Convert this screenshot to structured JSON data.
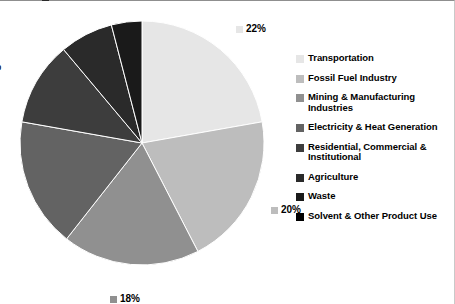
{
  "chart_data": {
    "type": "pie",
    "title": "",
    "subtitle": "",
    "xlabel": "",
    "ylabel": "",
    "grid": false,
    "legend_position": "right",
    "start_angle_deg": 0,
    "direction": "clockwise",
    "categories": [
      "Transportation",
      "Fossil Fuel Industry",
      "Mining & Manufacturing Industries",
      "Electricity & Heat Generation",
      "Residential, Commercial & Institutional",
      "Agriculture",
      "Waste",
      "Solvent & Other Product Use"
    ],
    "values": [
      22,
      20,
      18,
      17,
      11,
      7,
      4,
      0
    ],
    "labels": [
      "22%",
      "20%",
      "18%",
      "17%",
      "11%",
      "7%",
      "4%",
      "0%"
    ],
    "colors": [
      "#e6e6e6",
      "#bdbdbd",
      "#909090",
      "#636363",
      "#3d3d3d",
      "#2a2a2a",
      "#1a1a1a",
      "#000000"
    ],
    "slices": [
      {
        "label": "Transportation",
        "value": 22,
        "display": "22%",
        "color": "#e6e6e6"
      },
      {
        "label": "Fossil Fuel Industry",
        "value": 20,
        "display": "20%",
        "color": "#bdbdbd"
      },
      {
        "label": "Mining & Manufacturing Industries",
        "value": 18,
        "display": "18%",
        "color": "#909090"
      },
      {
        "label": "Electricity & Heat Generation",
        "value": 17,
        "display": "17%",
        "color": "#636363"
      },
      {
        "label": "Residential, Commercial & Institutional",
        "value": 11,
        "display": "11%",
        "color": "#3d3d3d"
      },
      {
        "label": "Agriculture",
        "value": 7,
        "display": "7%",
        "color": "#2a2a2a"
      },
      {
        "label": "Waste",
        "value": 4,
        "display": "4%",
        "color": "#1a1a1a"
      },
      {
        "label": "Solvent & Other Product Use",
        "value": 0,
        "display": "0%",
        "color": "#000000"
      }
    ]
  },
  "legend": {
    "items": [
      {
        "label": "Transportation",
        "color": "#e6e6e6"
      },
      {
        "label": "Fossil Fuel Industry",
        "color": "#bdbdbd"
      },
      {
        "label": "Mining & Manufacturing Industries",
        "color": "#909090"
      },
      {
        "label": "Electricity & Heat Generation",
        "color": "#636363"
      },
      {
        "label": "Residential, Commercial & Institutional",
        "color": "#3d3d3d"
      },
      {
        "label": "Agriculture",
        "color": "#2a2a2a"
      },
      {
        "label": "Waste",
        "color": "#1a1a1a"
      },
      {
        "label": "Solvent & Other Product Use",
        "color": "#000000"
      }
    ]
  }
}
